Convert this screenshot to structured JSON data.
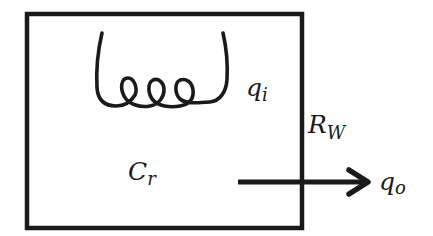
{
  "diagram": {
    "colors": {
      "stroke": "#1a1a1a",
      "background": "#ffffff"
    },
    "labels": {
      "heat_input": {
        "base": "q",
        "subscript": "i"
      },
      "wall_resistance": {
        "base": "R",
        "subscript": "W"
      },
      "room_capacitance": {
        "base": "C",
        "subscript": "r"
      },
      "heat_output": {
        "base": "q",
        "subscript": "o"
      }
    },
    "elements": {
      "room": "room-box",
      "heater": "heater-coil",
      "heat_flow": "heat-flow-arrow"
    }
  }
}
